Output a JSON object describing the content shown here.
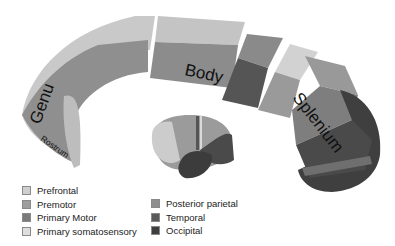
{
  "diagram": {
    "structure": "Corpus callosum",
    "region_labels": {
      "genu": "Genu",
      "rostrum": "Rostrum",
      "body": "Body",
      "splenium": "Splenium"
    }
  },
  "legend": {
    "col1": [
      {
        "label": "Prefrontal",
        "color": "#cfcfcf"
      },
      {
        "label": "Premotor",
        "color": "#9e9e9e"
      },
      {
        "label": "Primary Motor",
        "color": "#7a7a7a"
      },
      {
        "label": "Primary somatosensory",
        "color": "#dedede"
      }
    ],
    "col2": [
      {
        "label": "Posterior parietal",
        "color": "#8f8f8f"
      },
      {
        "label": "Temporal",
        "color": "#5a5a5a"
      },
      {
        "label": "Occipital",
        "color": "#3e3e3e"
      }
    ]
  },
  "colors": {
    "prefrontal": "#cfcfcf",
    "premotor": "#9e9e9e",
    "primary_motor": "#7a7a7a",
    "primary_somatosensory": "#dedede",
    "posterior_parietal": "#8f8f8f",
    "temporal": "#5a5a5a",
    "occipital": "#3e3e3e"
  }
}
